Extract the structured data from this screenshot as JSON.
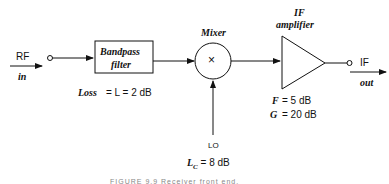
{
  "input": {
    "label": "RF",
    "sub": "in"
  },
  "filter": {
    "title_line1": "Bandpass",
    "title_line2": "filter",
    "loss_text": "Loss",
    "loss_eq": "= L = 2 dB"
  },
  "mixer": {
    "title": "Mixer",
    "symbol": "×",
    "lo_label": "LO",
    "lc_label": "L",
    "lc_sub": "C",
    "lc_value": "= 8 dB"
  },
  "amplifier": {
    "title_line1": "IF",
    "title_line2": "amplifier",
    "f_label": "F",
    "f_value": "= 5 dB",
    "g_label": "G",
    "g_value": "= 20 dB"
  },
  "output": {
    "label": "IF",
    "sub": "out"
  },
  "caption": "FIGURE 9.9  Receiver front end."
}
